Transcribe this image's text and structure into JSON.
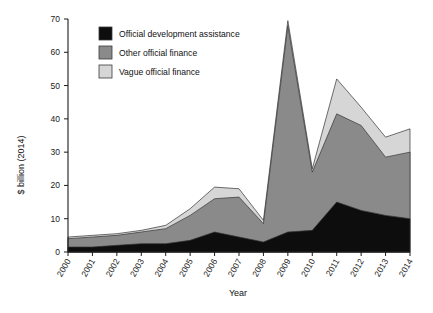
{
  "chart_data": {
    "type": "area",
    "stacked": true,
    "title": "",
    "xlabel": "Year",
    "ylabel": "$ billion (2014)",
    "categories": [
      "2000",
      "2001",
      "2002",
      "2003",
      "2004",
      "2005",
      "2006",
      "2007",
      "2008",
      "2009",
      "2010",
      "2011",
      "2012",
      "2013",
      "2014"
    ],
    "x": [
      2000,
      2001,
      2002,
      2003,
      2004,
      2005,
      2006,
      2007,
      2008,
      2009,
      2010,
      2011,
      2012,
      2013,
      2014
    ],
    "ylim": [
      0,
      70
    ],
    "yticks": [
      0,
      10,
      20,
      30,
      40,
      50,
      60,
      70
    ],
    "ytick_labels": [
      "0",
      "10",
      "20",
      "30",
      "40",
      "50",
      "60",
      "70"
    ],
    "xlim": [
      2000,
      2014
    ],
    "grid": false,
    "legend_position": "top-left-inside",
    "series": [
      {
        "name": "Official development assistance",
        "color": "#0d0d0d",
        "values": [
          1.5,
          1.5,
          2.0,
          2.5,
          2.5,
          3.5,
          6.0,
          4.5,
          3.0,
          6.0,
          6.5,
          15.0,
          12.5,
          11.0,
          10.0
        ]
      },
      {
        "name": "Other official finance",
        "color": "#8a8a8a",
        "values": [
          2.5,
          3.0,
          3.0,
          3.5,
          4.5,
          7.5,
          10.0,
          12.0,
          5.5,
          62.0,
          17.5,
          26.5,
          25.5,
          17.5,
          20.0
        ]
      },
      {
        "name": "Vague official finance",
        "color": "#d6d6d6",
        "values": [
          0.5,
          0.5,
          0.5,
          0.5,
          1.0,
          2.0,
          3.5,
          2.5,
          1.0,
          1.5,
          1.0,
          10.5,
          5.5,
          6.0,
          7.0
        ]
      }
    ],
    "totals": [
      4.5,
      5.0,
      5.5,
      6.5,
      8.0,
      13.0,
      19.5,
      19.0,
      9.5,
      69.5,
      25.0,
      52.0,
      43.5,
      34.5,
      37.0
    ]
  },
  "legend": {
    "items": [
      {
        "label": "Official development assistance",
        "color": "#0d0d0d"
      },
      {
        "label": "Other official finance",
        "color": "#8a8a8a"
      },
      {
        "label": "Vague official finance",
        "color": "#d6d6d6"
      }
    ]
  },
  "axes": {
    "y_title": "$ billion (2014)",
    "x_title": "Year"
  }
}
